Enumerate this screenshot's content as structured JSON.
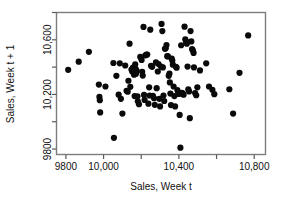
{
  "chart_data": {
    "type": "scatter",
    "title": "",
    "xlabel": "Sales, Week t",
    "ylabel": "Sales, Week t + 1",
    "xlim": [
      9750,
      10860
    ],
    "ylim": [
      9760,
      10800
    ],
    "grid": false,
    "legend": null,
    "marker": {
      "shape": "circle",
      "color": "#0a0a0a",
      "size": 3.1
    },
    "x_ticks": [
      9800,
      10000,
      10200,
      10400,
      10600,
      10800
    ],
    "x_tick_labels": [
      "9800",
      "10,000",
      "",
      "10,400",
      "",
      "10,800"
    ],
    "y_ticks": [
      9800,
      10000,
      10200,
      10400,
      10600,
      10800
    ],
    "y_tick_labels": [
      "9800",
      "",
      "10,200",
      "",
      "10,600",
      ""
    ],
    "n_points": 120,
    "points": [
      [
        9812,
        10380
      ],
      [
        9868,
        10440
      ],
      [
        9922,
        10512
      ],
      [
        9975,
        10272
      ],
      [
        9978,
        10182
      ],
      [
        9980,
        10158
      ],
      [
        9982,
        10068
      ],
      [
        10010,
        10258
      ],
      [
        10052,
        10430
      ],
      [
        10055,
        9882
      ],
      [
        10068,
        10336
      ],
      [
        10080,
        10198
      ],
      [
        10086,
        10428
      ],
      [
        10092,
        10168
      ],
      [
        10100,
        10060
      ],
      [
        10115,
        10412
      ],
      [
        10122,
        10226
      ],
      [
        10128,
        10220
      ],
      [
        10132,
        10300
      ],
      [
        10138,
        10572
      ],
      [
        10142,
        10256
      ],
      [
        10148,
        10382
      ],
      [
        10152,
        10368
      ],
      [
        10156,
        10396
      ],
      [
        10158,
        10378
      ],
      [
        10160,
        10366
      ],
      [
        10162,
        10344
      ],
      [
        10165,
        10188
      ],
      [
        10168,
        10420
      ],
      [
        10170,
        10388
      ],
      [
        10172,
        10352
      ],
      [
        10176,
        10372
      ],
      [
        10180,
        10186
      ],
      [
        10182,
        10150
      ],
      [
        10188,
        10128
      ],
      [
        10195,
        10476
      ],
      [
        10198,
        10470
      ],
      [
        10202,
        10452
      ],
      [
        10205,
        10366
      ],
      [
        10208,
        10338
      ],
      [
        10212,
        10694
      ],
      [
        10215,
        10196
      ],
      [
        10218,
        10160
      ],
      [
        10222,
        10486
      ],
      [
        10228,
        10492
      ],
      [
        10232,
        10492
      ],
      [
        10238,
        10132
      ],
      [
        10242,
        10252
      ],
      [
        10245,
        10192
      ],
      [
        10248,
        10674
      ],
      [
        10252,
        10410
      ],
      [
        10258,
        10402
      ],
      [
        10262,
        10190
      ],
      [
        10268,
        10172
      ],
      [
        10272,
        10124
      ],
      [
        10278,
        10434
      ],
      [
        10282,
        10246
      ],
      [
        10288,
        10368
      ],
      [
        10292,
        10422
      ],
      [
        10296,
        10168
      ],
      [
        10300,
        10112
      ],
      [
        10305,
        10404
      ],
      [
        10308,
        10716
      ],
      [
        10312,
        10664
      ],
      [
        10315,
        10398
      ],
      [
        10318,
        10192
      ],
      [
        10322,
        10152
      ],
      [
        10326,
        10534
      ],
      [
        10330,
        10538
      ],
      [
        10334,
        10562
      ],
      [
        10338,
        10480
      ],
      [
        10342,
        10478
      ],
      [
        10346,
        10336
      ],
      [
        10350,
        10352
      ],
      [
        10352,
        10288
      ],
      [
        10355,
        10206
      ],
      [
        10358,
        10122
      ],
      [
        10362,
        10462
      ],
      [
        10365,
        10448
      ],
      [
        10368,
        10418
      ],
      [
        10372,
        10258
      ],
      [
        10376,
        10188
      ],
      [
        10380,
        10112
      ],
      [
        10384,
        10402
      ],
      [
        10388,
        10396
      ],
      [
        10392,
        10232
      ],
      [
        10396,
        10216
      ],
      [
        10400,
        10204
      ],
      [
        10404,
        10050
      ],
      [
        10408,
        9810
      ],
      [
        10412,
        10560
      ],
      [
        10416,
        10212
      ],
      [
        10420,
        10208
      ],
      [
        10425,
        10198
      ],
      [
        10430,
        10696
      ],
      [
        10434,
        10604
      ],
      [
        10438,
        10588
      ],
      [
        10442,
        10572
      ],
      [
        10446,
        10404
      ],
      [
        10450,
        10238
      ],
      [
        10454,
        10222
      ],
      [
        10458,
        10026
      ],
      [
        10462,
        10664
      ],
      [
        10466,
        10588
      ],
      [
        10470,
        10532
      ],
      [
        10474,
        10522
      ],
      [
        10478,
        10504
      ],
      [
        10480,
        10398
      ],
      [
        10486,
        10210
      ],
      [
        10492,
        10194
      ],
      [
        10498,
        10252
      ],
      [
        10512,
        10376
      ],
      [
        10545,
        10428
      ],
      [
        10560,
        10258
      ],
      [
        10578,
        10234
      ],
      [
        10588,
        10202
      ],
      [
        10668,
        10238
      ],
      [
        10688,
        10060
      ],
      [
        10722,
        10358
      ],
      [
        10768,
        10632
      ]
    ]
  },
  "axes": {
    "x_title": "Sales, Week t",
    "y_title": "Sales, Week t + 1"
  }
}
